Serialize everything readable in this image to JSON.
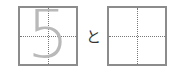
{
  "exercise": {
    "trace_character": "5",
    "connector": "と",
    "answer_box_value": ""
  },
  "colors": {
    "box_border": "#8c8c8c",
    "guide_lines": "#777777",
    "trace_glyph": "#b9b9b9"
  }
}
